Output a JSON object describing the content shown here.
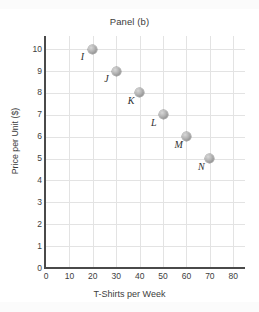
{
  "chart_data": {
    "type": "scatter",
    "title": "Panel (b)",
    "xlabel": "T-Shirts per Week",
    "ylabel": "Price per Unit ($)",
    "xlim": [
      0,
      85
    ],
    "ylim": [
      0,
      10.6
    ],
    "xticks": [
      0,
      10,
      20,
      30,
      40,
      50,
      60,
      70,
      80
    ],
    "yticks": [
      0,
      1,
      2,
      3,
      4,
      5,
      6,
      7,
      8,
      9,
      10
    ],
    "grid": true,
    "legend": "none",
    "points": [
      {
        "label": "I",
        "x": 20,
        "y": 10
      },
      {
        "label": "J",
        "x": 30,
        "y": 9
      },
      {
        "label": "K",
        "x": 40,
        "y": 8
      },
      {
        "label": "L",
        "x": 50,
        "y": 7
      },
      {
        "label": "M",
        "x": 60,
        "y": 6
      },
      {
        "label": "N",
        "x": 70,
        "y": 5
      }
    ]
  }
}
